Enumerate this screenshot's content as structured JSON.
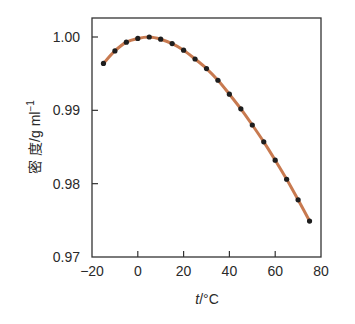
{
  "chart_data": {
    "type": "line",
    "title": "",
    "xlabel": "t/°C",
    "xlabel_italic": "t",
    "xlabel_rest": "/°C",
    "ylabel": "密 度/g ml⁻¹",
    "ylabel_main": "密 度/g ml",
    "ylabel_sup": "−1",
    "xlim": [
      -20,
      80
    ],
    "ylim": [
      0.97,
      1.002
    ],
    "x_ticks": [
      -20,
      0,
      20,
      40,
      60,
      80
    ],
    "x_tick_labels": [
      "−20",
      "0",
      "20",
      "40",
      "60",
      "80"
    ],
    "y_ticks": [
      0.97,
      0.98,
      0.99,
      1.0
    ],
    "y_tick_labels": [
      "0.97",
      "0.98",
      "0.99",
      "1.00"
    ],
    "grid": false,
    "legend": null,
    "series": [
      {
        "name": "water density",
        "line_color": "#c87a50",
        "marker_color": "#1e1e1e",
        "x": [
          -15,
          -10,
          -5,
          0,
          5,
          10,
          15,
          20,
          25,
          30,
          35,
          40,
          45,
          50,
          55,
          60,
          65,
          70,
          75
        ],
        "values": [
          0.9964,
          0.9981,
          0.9993,
          0.9998,
          1.0,
          0.9997,
          0.9991,
          0.9982,
          0.997,
          0.9957,
          0.9941,
          0.9922,
          0.9902,
          0.988,
          0.9857,
          0.9832,
          0.9806,
          0.9778,
          0.9749
        ]
      }
    ]
  }
}
